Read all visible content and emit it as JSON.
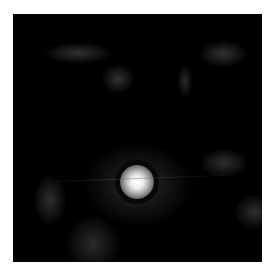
{
  "image": {
    "description": "Grayscale dark-field image with a bright central point source and faint diffuse blobs",
    "background_color": "#000000",
    "border_color": "#ffffff",
    "bright_spot": {
      "x": 137,
      "y": 182,
      "core_color": "#ffffff"
    }
  }
}
